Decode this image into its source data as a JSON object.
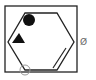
{
  "figure": {
    "description": "Square frame containing a hexagon with a filled circle, filled triangle, open circle at lower-left vertex, inner parallel line on lower-right edge, and a small 'Ø' mark outside on the right",
    "stroke_color": "#222222",
    "fill_color": "#111111",
    "faint_color": "#999999",
    "frame": {
      "x": 5,
      "y": 6,
      "width": 72,
      "height": 66
    },
    "hexagon": {
      "points": "25,13 57,13 74,42 57,70 25,70 8,42"
    },
    "filled_circle": {
      "cx": 29,
      "cy": 20,
      "r": 6
    },
    "filled_triangle": {
      "points": "12,43 25,43 19,33"
    },
    "open_circle": {
      "cx": 25,
      "cy": 70,
      "r": 5
    },
    "inner_line": {
      "x1": 53,
      "y1": 68,
      "x2": 66,
      "y2": 48
    },
    "outside_mark": {
      "text": "Ø",
      "x": 82,
      "y": 42
    }
  }
}
